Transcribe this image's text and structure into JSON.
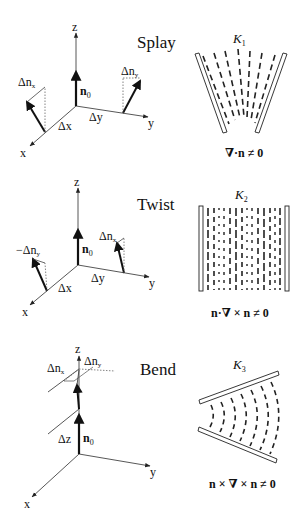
{
  "panels": [
    {
      "title": "Splay",
      "axes": {
        "z": "z",
        "y": "y",
        "x": "x"
      },
      "labels": {
        "n0": "n",
        "n0_sub": "0",
        "dnx": "Δn",
        "dnx_sub": "x",
        "dny": "Δn",
        "dny_sub": "y",
        "dx": "Δx",
        "dy": "Δy"
      },
      "constant": "K",
      "constant_sub": "1",
      "condition": "∇·n ≠ 0"
    },
    {
      "title": "Twist",
      "axes": {
        "z": "z",
        "y": "y",
        "x": "x"
      },
      "labels": {
        "n0": "n",
        "n0_sub": "0",
        "dnx": "Δn",
        "dnx_sub": "x",
        "dny": "−Δn",
        "dny_sub": "y",
        "dx": "Δx",
        "dy": "Δy"
      },
      "constant": "K",
      "constant_sub": "2",
      "condition": "n·∇ × n ≠ 0"
    },
    {
      "title": "Bend",
      "axes": {
        "z": "z",
        "y": "y",
        "x": "x"
      },
      "labels": {
        "n0": "n",
        "n0_sub": "0",
        "dnx": "Δn",
        "dnx_sub": "x",
        "dny": "Δn",
        "dny_sub": "y",
        "dz": "Δz"
      },
      "constant": "K",
      "constant_sub": "3",
      "condition": "n × ∇ × n ≠ 0"
    }
  ],
  "colors": {
    "ink": "#111111",
    "axis": "#444444",
    "dotted": "#666666",
    "background": "#ffffff"
  }
}
